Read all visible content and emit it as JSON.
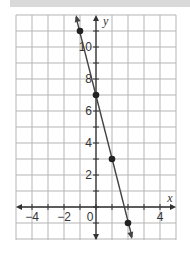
{
  "chart_data": {
    "type": "line",
    "title": "",
    "xlabel": "x",
    "ylabel": "y",
    "xlim": [
      -5,
      5
    ],
    "ylim": [
      -2,
      12
    ],
    "grid": true,
    "x_ticks": [
      -4,
      -2,
      0,
      4
    ],
    "y_ticks": [
      2,
      4,
      6,
      8,
      10
    ],
    "x_tick_labels": [
      "−4",
      "−2",
      "0",
      "4"
    ],
    "y_tick_labels": [
      "2",
      "4",
      "6",
      "8",
      "10"
    ],
    "series": [
      {
        "name": "line",
        "x": [
          -1,
          0,
          1,
          2
        ],
        "y": [
          11,
          7,
          3,
          -1
        ],
        "equation": "y = -4x + 7"
      }
    ],
    "points": [
      {
        "x": -1,
        "y": 11
      },
      {
        "x": 0,
        "y": 7
      },
      {
        "x": 1,
        "y": 3
      },
      {
        "x": 2,
        "y": -1
      }
    ]
  }
}
